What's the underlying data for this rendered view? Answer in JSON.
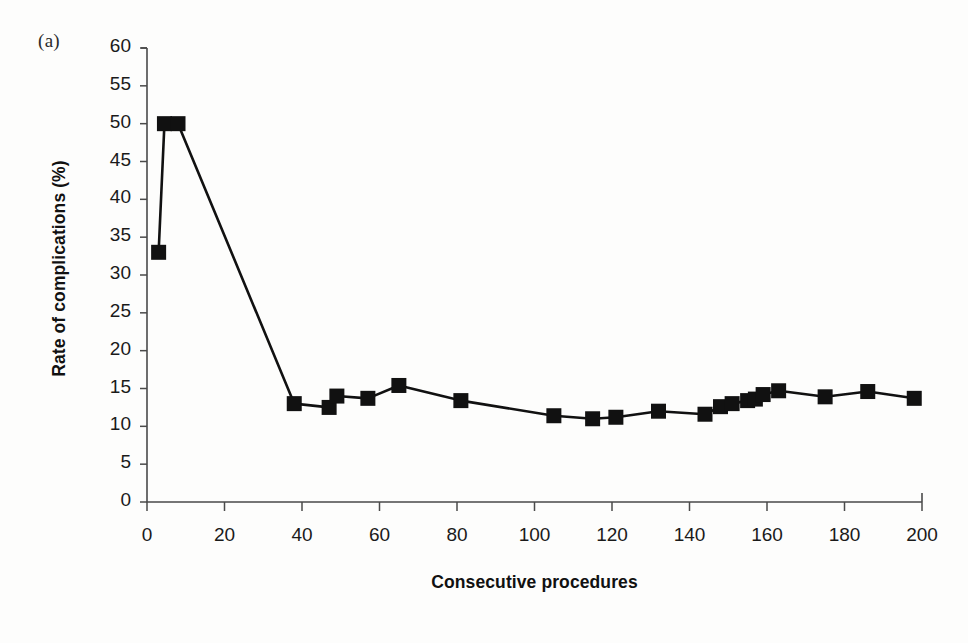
{
  "figure": {
    "panel_label": "(a)",
    "background_color": "#fdfdfc",
    "ink_color": "#111111"
  },
  "chart_data": {
    "type": "line",
    "title": "",
    "subtitle": "",
    "panel": "(a)",
    "xlabel": "Consecutive procedures",
    "ylabel": "Rate of complications (%)",
    "xlim": [
      0,
      200
    ],
    "ylim": [
      0,
      60
    ],
    "xticks": [
      0,
      20,
      40,
      60,
      80,
      100,
      120,
      140,
      160,
      180,
      200
    ],
    "yticks": [
      0,
      5,
      10,
      15,
      20,
      25,
      30,
      35,
      40,
      45,
      50,
      55,
      60
    ],
    "grid": false,
    "legend": null,
    "legend_position": "none",
    "marker": "square",
    "marker_color": "#111111",
    "line_color": "#111111",
    "series": [
      {
        "name": "Rate of complications",
        "points": [
          {
            "x": 3,
            "y": 33.0
          },
          {
            "x": 4.5,
            "y": 50.0
          },
          {
            "x": 8,
            "y": 50.0
          },
          {
            "x": 38,
            "y": 13.0
          },
          {
            "x": 47,
            "y": 12.5
          },
          {
            "x": 49,
            "y": 14.0
          },
          {
            "x": 57,
            "y": 13.7
          },
          {
            "x": 65,
            "y": 15.4
          },
          {
            "x": 81,
            "y": 13.4
          },
          {
            "x": 105,
            "y": 11.4
          },
          {
            "x": 115,
            "y": 11.0
          },
          {
            "x": 121,
            "y": 11.2
          },
          {
            "x": 132,
            "y": 12.0
          },
          {
            "x": 144,
            "y": 11.6
          },
          {
            "x": 148,
            "y": 12.6
          },
          {
            "x": 151,
            "y": 13.0
          },
          {
            "x": 155,
            "y": 13.4
          },
          {
            "x": 157,
            "y": 13.6
          },
          {
            "x": 159,
            "y": 14.2
          },
          {
            "x": 163,
            "y": 14.7
          },
          {
            "x": 175,
            "y": 13.9
          },
          {
            "x": 186,
            "y": 14.6
          },
          {
            "x": 198,
            "y": 13.7
          }
        ]
      }
    ]
  },
  "axes": {
    "x_tick_labels": [
      "0",
      "20",
      "40",
      "60",
      "80",
      "100",
      "120",
      "140",
      "160",
      "180",
      "200"
    ],
    "y_tick_labels": [
      "0",
      "5",
      "10",
      "15",
      "20",
      "25",
      "30",
      "35",
      "40",
      "45",
      "50",
      "55",
      "60"
    ]
  }
}
